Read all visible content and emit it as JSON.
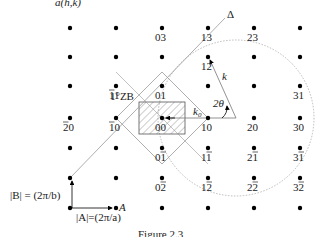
{
  "title": "a(h,k)",
  "caption": "Figure 2.3",
  "colors": {
    "dot": "#000000",
    "line": "#999999",
    "circle": "#aaaaaa",
    "hatch": "#555555",
    "text": "#222222"
  },
  "lattice": {
    "columns_x": [
      70,
      116,
      162,
      208,
      254,
      300
    ],
    "rows_y": [
      28,
      57,
      86,
      118,
      148,
      178,
      208
    ],
    "points": [
      {
        "h": 0,
        "k": 3,
        "label": "03"
      },
      {
        "h": 1,
        "k": 3,
        "label": "13"
      },
      {
        "h": 2,
        "k": 3,
        "label": "23"
      },
      {
        "h": 1,
        "k": 2,
        "label": "12"
      },
      {
        "h": -1,
        "k": 1,
        "label": "11",
        "bar": "first"
      },
      {
        "h": 0,
        "k": 1,
        "label": "01"
      },
      {
        "h": 3,
        "k": 1,
        "label": "31"
      },
      {
        "h": -2,
        "k": 0,
        "label": "20",
        "bar": "first"
      },
      {
        "h": -1,
        "k": 0,
        "label": "10",
        "bar": "first"
      },
      {
        "h": 0,
        "k": 0,
        "label": "00"
      },
      {
        "h": 1,
        "k": 0,
        "label": "10"
      },
      {
        "h": 2,
        "k": 0,
        "label": "20"
      },
      {
        "h": 3,
        "k": 0,
        "label": "30"
      },
      {
        "h": 0,
        "k": -1,
        "label": "01",
        "bar": "second"
      },
      {
        "h": 1,
        "k": -1,
        "label": "11",
        "bar": "second"
      },
      {
        "h": 2,
        "k": -1,
        "label": "21",
        "bar": "second"
      },
      {
        "h": 3,
        "k": -1,
        "label": "31",
        "bar": "second"
      },
      {
        "h": 0,
        "k": -2,
        "label": "02",
        "bar": "second"
      },
      {
        "h": 1,
        "k": -2,
        "label": "12",
        "bar": "second"
      },
      {
        "h": 2,
        "k": -2,
        "label": "22",
        "bar": "second"
      },
      {
        "h": 3,
        "k": -2,
        "label": "32",
        "bar": "second"
      }
    ]
  },
  "annotations": {
    "delta": "Δ",
    "zone": "1°ZB",
    "k": "k",
    "k0": "k",
    "k0_sub": "0",
    "two_theta": "2θ",
    "b_vector": "|B| = (2π/b)",
    "a_vector": "|A|=(2π/a)",
    "a_label": "A"
  }
}
